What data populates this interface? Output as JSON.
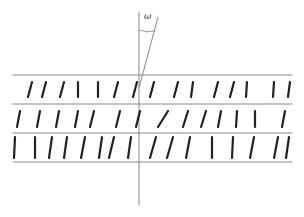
{
  "diagram": {
    "title": "",
    "angle_label": "ω",
    "colors": {
      "line": "#888888",
      "segment": "#222222",
      "background": "#ffffff"
    },
    "layers_y": [
      75,
      104,
      133,
      162
    ],
    "layer_x_range": [
      13,
      292
    ],
    "normal_axis": {
      "x": 139,
      "y1": 12,
      "y2": 205
    },
    "director": {
      "x1": 139,
      "y1": 88,
      "x2": 158,
      "y2": 17
    },
    "rows": [
      {
        "y1": 97,
        "y2": 82,
        "segments": [
          [
            28,
            -4
          ],
          [
            42,
            -4
          ],
          [
            60,
            -4
          ],
          [
            78,
            0
          ],
          [
            98,
            0
          ],
          [
            114,
            -4
          ],
          [
            133,
            -4
          ],
          [
            150,
            -4
          ],
          [
            174,
            -4
          ],
          [
            191,
            -2
          ],
          [
            214,
            -4
          ],
          [
            230,
            -4
          ],
          [
            246,
            -1
          ],
          [
            273,
            -1
          ],
          [
            288,
            -2
          ]
        ]
      },
      {
        "y1": 127,
        "y2": 111,
        "segments": [
          [
            17,
            -3
          ],
          [
            37,
            -3
          ],
          [
            56,
            -3
          ],
          [
            75,
            -3
          ],
          [
            90,
            -4
          ],
          [
            116,
            -4
          ],
          [
            136,
            -4
          ],
          [
            158,
            -10
          ],
          [
            183,
            -5
          ],
          [
            201,
            -5
          ],
          [
            218,
            -3
          ],
          [
            236,
            -1
          ],
          [
            255,
            0
          ],
          [
            282,
            -3
          ]
        ]
      },
      {
        "y1": 158,
        "y2": 137,
        "segments": [
          [
            14,
            -1
          ],
          [
            35,
            0
          ],
          [
            49,
            -3
          ],
          [
            64,
            -3
          ],
          [
            81,
            -4
          ],
          [
            99,
            -3
          ],
          [
            109,
            -5
          ],
          [
            128,
            -3
          ],
          [
            150,
            -6
          ],
          [
            167,
            -6
          ],
          [
            186,
            -4
          ],
          [
            212,
            0
          ],
          [
            232,
            -1
          ],
          [
            250,
            -4
          ],
          [
            274,
            -4
          ],
          [
            286,
            -3
          ]
        ]
      }
    ]
  }
}
